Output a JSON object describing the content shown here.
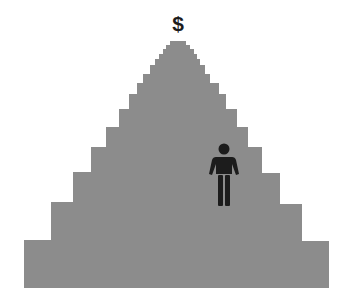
{
  "diagram": {
    "type": "stepped-pyramid",
    "symbol_at_top": "$",
    "figure": "person-icon",
    "colors": {
      "pyramid": "#8c8c8c",
      "figure": "#1c1c1c",
      "symbol": "#1c1c1c",
      "background": "#ffffff"
    }
  }
}
